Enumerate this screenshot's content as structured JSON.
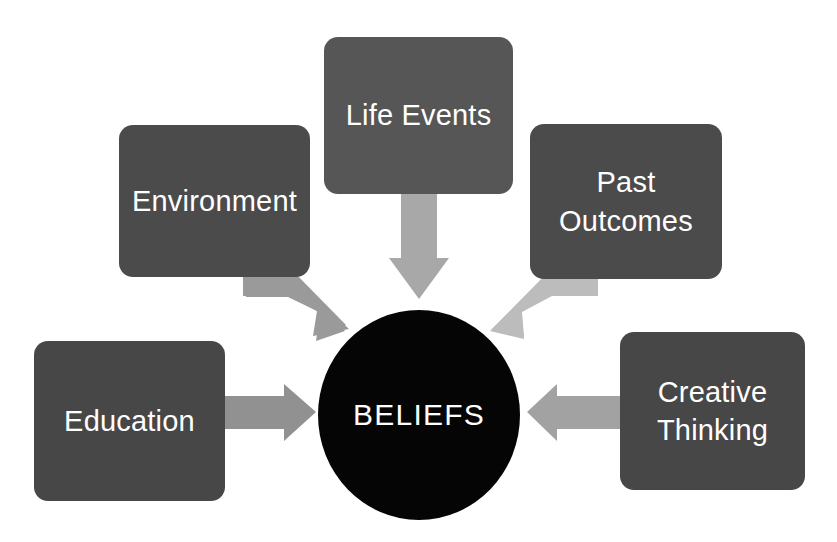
{
  "diagram": {
    "background_color": "#ffffff",
    "center": {
      "id": "beliefs",
      "label": "BELIEFS",
      "shape": "ellipse",
      "fill_color": "#050505",
      "text_color": "#ffffff"
    },
    "nodes": [
      {
        "id": "environment",
        "label": "Environment",
        "shape": "rounded-rectangle",
        "fill_color": "#4b4b4b",
        "text_color": "#ffffff",
        "position": "top-left"
      },
      {
        "id": "life-events",
        "label": "Life Events",
        "shape": "rounded-rectangle",
        "fill_color": "#565656",
        "text_color": "#ffffff",
        "position": "top-center"
      },
      {
        "id": "past-outcomes",
        "label": "Past\nOutcomes",
        "shape": "rounded-rectangle",
        "fill_color": "#4b4b4b",
        "text_color": "#ffffff",
        "position": "top-right"
      },
      {
        "id": "education",
        "label": "Education",
        "shape": "rounded-rectangle",
        "fill_color": "#474747",
        "text_color": "#ffffff",
        "position": "bottom-left"
      },
      {
        "id": "creative-thinking",
        "label": "Creative\nThinking",
        "shape": "rounded-rectangle",
        "fill_color": "#474747",
        "text_color": "#ffffff",
        "position": "bottom-right"
      }
    ],
    "arrows": [
      {
        "id": "arrow-environment-to-beliefs",
        "from": "environment",
        "to": "beliefs",
        "direction": "down-right",
        "color": "#9a9a9a"
      },
      {
        "id": "arrow-life-events-to-beliefs",
        "from": "life-events",
        "to": "beliefs",
        "direction": "down",
        "color": "#a8a8a8"
      },
      {
        "id": "arrow-past-outcomes-to-beliefs",
        "from": "past-outcomes",
        "to": "beliefs",
        "direction": "down-left",
        "color": "#bcbcbc"
      },
      {
        "id": "arrow-education-to-beliefs",
        "from": "education",
        "to": "beliefs",
        "direction": "right",
        "color": "#919191"
      },
      {
        "id": "arrow-creative-thinking-to-beliefs",
        "from": "creative-thinking",
        "to": "beliefs",
        "direction": "left",
        "color": "#a2a2a2"
      }
    ]
  }
}
